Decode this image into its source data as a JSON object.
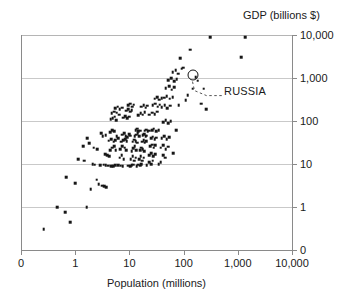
{
  "chart_data": {
    "type": "scatter",
    "title": "",
    "xlabel": "Population (millions)",
    "ylabel": "GDP (billions $)",
    "xscale": "log",
    "yscale": "log",
    "xlim": [
      0.1,
      10000
    ],
    "ylim": [
      0.1,
      10000
    ],
    "xticks": [
      "0",
      "1",
      "10",
      "100",
      "1,000",
      "10,000"
    ],
    "yticks": [
      "0",
      "1",
      "10",
      "100",
      "1,000",
      "10,000"
    ],
    "grid": "horizontal",
    "legend": "none",
    "marker": "small black square",
    "annotations": [
      {
        "label": "RUSSIA",
        "marker": "open circle",
        "x": 146,
        "y": 1200,
        "leader": "dashed"
      }
    ],
    "points": [
      [
        0.25,
        0.3
      ],
      [
        0.45,
        1.0
      ],
      [
        0.62,
        0.75
      ],
      [
        0.78,
        0.45
      ],
      [
        0.65,
        5.0
      ],
      [
        0.95,
        3.6
      ],
      [
        1.1,
        13
      ],
      [
        1.4,
        12
      ],
      [
        1.55,
        1.0
      ],
      [
        1.85,
        2.6
      ],
      [
        2.0,
        9.8
      ],
      [
        2.2,
        9.6
      ],
      [
        2.4,
        4.3
      ],
      [
        2.6,
        3.4
      ],
      [
        2.8,
        9.4
      ],
      [
        2.45,
        22
      ],
      [
        2.1,
        24
      ],
      [
        1.75,
        30
      ],
      [
        1.6,
        40
      ],
      [
        1.35,
        26
      ],
      [
        3.0,
        3.1
      ],
      [
        3.3,
        3.0
      ],
      [
        3.6,
        2.9
      ],
      [
        3.2,
        9.7
      ],
      [
        3.5,
        9.5
      ],
      [
        3.9,
        9.2
      ],
      [
        3.4,
        17
      ],
      [
        3.7,
        16
      ],
      [
        4.1,
        15
      ],
      [
        4.4,
        9.0
      ],
      [
        4.8,
        8.8
      ],
      [
        5.2,
        9.5
      ],
      [
        4.2,
        21
      ],
      [
        4.6,
        24
      ],
      [
        5.0,
        26
      ],
      [
        5.4,
        21
      ],
      [
        4.0,
        35
      ],
      [
        4.4,
        38
      ],
      [
        4.9,
        33
      ],
      [
        5.3,
        36
      ],
      [
        3.1,
        44
      ],
      [
        3.5,
        47
      ],
      [
        2.9,
        52
      ],
      [
        4.2,
        55
      ],
      [
        4.6,
        62
      ],
      [
        5.0,
        58
      ],
      [
        5.6,
        45
      ],
      [
        6.0,
        40
      ],
      [
        4.3,
        110
      ],
      [
        4.7,
        115
      ],
      [
        5.1,
        125
      ],
      [
        5.5,
        105
      ],
      [
        4.5,
        150
      ],
      [
        5.0,
        165
      ],
      [
        5.6,
        155
      ],
      [
        6.2,
        140
      ],
      [
        5.2,
        200
      ],
      [
        5.8,
        215
      ],
      [
        6.4,
        190
      ],
      [
        7.0,
        205
      ],
      [
        6.0,
        9.4
      ],
      [
        6.6,
        9.2
      ],
      [
        7.2,
        9.0
      ],
      [
        6.3,
        14
      ],
      [
        6.9,
        16
      ],
      [
        7.5,
        13
      ],
      [
        6.5,
        22
      ],
      [
        7.1,
        26
      ],
      [
        7.8,
        24
      ],
      [
        8.4,
        21
      ],
      [
        6.8,
        33
      ],
      [
        7.4,
        36
      ],
      [
        8.0,
        38
      ],
      [
        8.6,
        34
      ],
      [
        7.0,
        48
      ],
      [
        7.6,
        52
      ],
      [
        8.2,
        45
      ],
      [
        8.8,
        42
      ],
      [
        9.4,
        50
      ],
      [
        10.0,
        46
      ],
      [
        7.3,
        120
      ],
      [
        8.0,
        130
      ],
      [
        8.7,
        115
      ],
      [
        9.4,
        125
      ],
      [
        8.3,
        175
      ],
      [
        9.0,
        190
      ],
      [
        9.8,
        165
      ],
      [
        10.6,
        180
      ],
      [
        9.2,
        230
      ],
      [
        10.0,
        250
      ],
      [
        10.8,
        215
      ],
      [
        11.6,
        240
      ],
      [
        9.0,
        9.2
      ],
      [
        9.8,
        9.0
      ],
      [
        10.6,
        9.4
      ],
      [
        11.4,
        9.6
      ],
      [
        10.2,
        13
      ],
      [
        11.0,
        15
      ],
      [
        11.8,
        12
      ],
      [
        12.6,
        14
      ],
      [
        10.5,
        20
      ],
      [
        11.3,
        23
      ],
      [
        12.1,
        26
      ],
      [
        12.9,
        21
      ],
      [
        11.0,
        33
      ],
      [
        11.8,
        37
      ],
      [
        12.6,
        34
      ],
      [
        13.4,
        31
      ],
      [
        12.0,
        44
      ],
      [
        12.8,
        48
      ],
      [
        13.6,
        52
      ],
      [
        14.4,
        45
      ],
      [
        12.5,
        62
      ],
      [
        13.3,
        66
      ],
      [
        14.1,
        58
      ],
      [
        15.0,
        60
      ],
      [
        13.0,
        9.0
      ],
      [
        14.0,
        9.6
      ],
      [
        15.0,
        9.2
      ],
      [
        16.0,
        10
      ],
      [
        14.5,
        13
      ],
      [
        15.5,
        15
      ],
      [
        16.5,
        12
      ],
      [
        17.5,
        14
      ],
      [
        15.0,
        21
      ],
      [
        16.0,
        24
      ],
      [
        17.0,
        22
      ],
      [
        18.0,
        20
      ],
      [
        16.5,
        33
      ],
      [
        17.5,
        36
      ],
      [
        18.5,
        31
      ],
      [
        19.5,
        34
      ],
      [
        17.0,
        47
      ],
      [
        18.0,
        50
      ],
      [
        19.0,
        44
      ],
      [
        20.0,
        46
      ],
      [
        18.5,
        60
      ],
      [
        19.5,
        63
      ],
      [
        21.0,
        57
      ],
      [
        22.0,
        59
      ],
      [
        14.0,
        135
      ],
      [
        15.5,
        150
      ],
      [
        17.0,
        140
      ],
      [
        18.5,
        160
      ],
      [
        16.0,
        215
      ],
      [
        17.5,
        235
      ],
      [
        19.0,
        205
      ],
      [
        20.5,
        225
      ],
      [
        20.0,
        9.5
      ],
      [
        22.0,
        11
      ],
      [
        24.0,
        10
      ],
      [
        26.0,
        12
      ],
      [
        22.5,
        16
      ],
      [
        24.5,
        18
      ],
      [
        26.5,
        15
      ],
      [
        28.5,
        17
      ],
      [
        23.0,
        26
      ],
      [
        25.0,
        28
      ],
      [
        27.0,
        24
      ],
      [
        29.0,
        27
      ],
      [
        24.0,
        40
      ],
      [
        26.0,
        43
      ],
      [
        28.0,
        38
      ],
      [
        30.0,
        41
      ],
      [
        25.0,
        62
      ],
      [
        27.0,
        66
      ],
      [
        30.0,
        58
      ],
      [
        33.0,
        61
      ],
      [
        22.0,
        140
      ],
      [
        25.0,
        155
      ],
      [
        28.0,
        145
      ],
      [
        31.0,
        165
      ],
      [
        26.0,
        230
      ],
      [
        29.0,
        250
      ],
      [
        32.0,
        215
      ],
      [
        35.0,
        240
      ],
      [
        28.0,
        330
      ],
      [
        31.0,
        355
      ],
      [
        34.0,
        310
      ],
      [
        38.0,
        340
      ],
      [
        33.0,
        9.8
      ],
      [
        36.0,
        11
      ],
      [
        40.0,
        16
      ],
      [
        44.0,
        14
      ],
      [
        36.0,
        24
      ],
      [
        40.0,
        27
      ],
      [
        45.0,
        22
      ],
      [
        50.0,
        25
      ],
      [
        38.0,
        40
      ],
      [
        42.0,
        44
      ],
      [
        47.0,
        38
      ],
      [
        52.0,
        42
      ],
      [
        40.0,
        95
      ],
      [
        45.0,
        105
      ],
      [
        50.0,
        88
      ],
      [
        55.0,
        98
      ],
      [
        38.0,
        210
      ],
      [
        43.0,
        230
      ],
      [
        48.0,
        200
      ],
      [
        54.0,
        225
      ],
      [
        42.0,
        350
      ],
      [
        47.0,
        380
      ],
      [
        53.0,
        330
      ],
      [
        60.0,
        360
      ],
      [
        45.0,
        580
      ],
      [
        52.0,
        640
      ],
      [
        58.0,
        540
      ],
      [
        65.0,
        610
      ],
      [
        50.0,
        900
      ],
      [
        57.0,
        980
      ],
      [
        64.0,
        850
      ],
      [
        72.0,
        930
      ],
      [
        60.0,
        1350
      ],
      [
        68.0,
        1500
      ],
      [
        76.0,
        1250
      ],
      [
        62.0,
        18
      ],
      [
        70.0,
        62
      ],
      [
        78.0,
        230
      ],
      [
        83.0,
        2900
      ],
      [
        88.0,
        1650
      ],
      [
        95.0,
        1750
      ],
      [
        105.0,
        300
      ],
      [
        115.0,
        400
      ],
      [
        128.0,
        4600
      ],
      [
        140.0,
        560
      ],
      [
        160.0,
        1050
      ],
      [
        175.0,
        870
      ],
      [
        200.0,
        250
      ],
      [
        225.0,
        560
      ],
      [
        250.0,
        190
      ],
      [
        300.0,
        9000
      ],
      [
        1100.0,
        3000
      ],
      [
        1320.0,
        8800
      ]
    ]
  },
  "annotation": {
    "russia_label": "RUSSIA"
  },
  "axes": {
    "y_title": "GDP (billions $)",
    "x_title": "Population (millions)",
    "y_labels": [
      "10,000",
      "1,000",
      "100",
      "10",
      "1",
      "0"
    ],
    "x_labels": [
      "0",
      "1",
      "10",
      "100",
      "1,000",
      "10,000"
    ]
  },
  "colors": {
    "marker": "#161616",
    "gridline": "#c9c9c9",
    "axis": "#8a8a8a",
    "text": "#1a1a1a"
  }
}
